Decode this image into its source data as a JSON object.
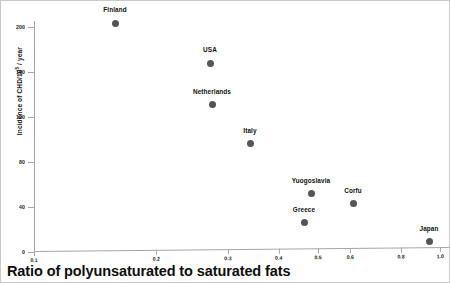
{
  "chart_data": {
    "type": "scatter",
    "title": "",
    "xlabel": "Ratio of polyunsaturated to saturated fats",
    "ylabel": "Incidence of CHD/10⁵ / year",
    "ylabel_base": "Incidence of CHD/10",
    "ylabel_exp": "5",
    "ylabel_tail": " / year",
    "xscale": "log",
    "yscale": "linear",
    "xlim": [
      0.1,
      1.05
    ],
    "ylim": [
      0,
      205
    ],
    "grid": false,
    "legend": "none",
    "x_ticks": [
      "0.1",
      "0.2",
      "0.3",
      "0.4",
      "0.5",
      "0.6",
      "0.8",
      "1.0"
    ],
    "x_tick_values": [
      0.1,
      0.2,
      0.3,
      0.4,
      0.5,
      0.6,
      0.8,
      1.0
    ],
    "y_ticks": [
      "0",
      "40",
      "80",
      "120",
      "160",
      "200"
    ],
    "y_tick_values": [
      0,
      40,
      80,
      120,
      160,
      200
    ],
    "point_color": "#555555",
    "axis_color": "#a5a5a5",
    "points": [
      {
        "label": "Finland",
        "x": 0.17,
        "y": 198,
        "px": 114,
        "py": 22,
        "lx": 114,
        "ly": 5
      },
      {
        "label": "USA",
        "x": 0.29,
        "y": 165,
        "px": 209,
        "py": 62,
        "lx": 209,
        "ly": 45
      },
      {
        "label": "Netherlands",
        "x": 0.29,
        "y": 128,
        "px": 211,
        "py": 103,
        "lx": 211,
        "ly": 87
      },
      {
        "label": "Italy",
        "x": 0.36,
        "y": 95,
        "px": 249,
        "py": 142,
        "lx": 249,
        "ly": 126
      },
      {
        "label": "Yuogoslavia",
        "x": 0.5,
        "y": 52,
        "px": 310,
        "py": 192,
        "lx": 310,
        "ly": 176
      },
      {
        "label": "Corfu",
        "x": 0.62,
        "y": 42,
        "px": 352,
        "py": 202,
        "lx": 352,
        "ly": 186
      },
      {
        "label": "Greece",
        "x": 0.48,
        "y": 27,
        "px": 303,
        "py": 221,
        "lx": 303,
        "ly": 205
      },
      {
        "label": "Japan",
        "x": 0.98,
        "y": 13,
        "px": 428,
        "py": 240,
        "lx": 428,
        "ly": 224
      }
    ]
  },
  "axes": {
    "y_title_base": "Incidence of CHD/10",
    "y_title_exp": "5",
    "y_title_tail": " / year",
    "x_title": "Ratio of polyunsaturated to saturated fats"
  }
}
